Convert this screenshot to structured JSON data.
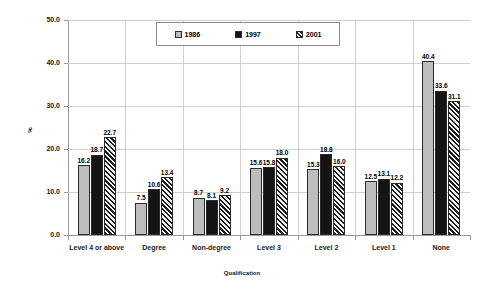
{
  "chart_data": {
    "type": "bar",
    "title": "",
    "xlabel": "Qualification",
    "ylabel": "%",
    "ylim": [
      0,
      50
    ],
    "ytick_labels": [
      "0.0",
      "10.0",
      "20.0",
      "30.0",
      "40.0",
      "50.0"
    ],
    "ytick_values": [
      0,
      10,
      20,
      30,
      40,
      50
    ],
    "grid": "horizontal-and-vertical",
    "legend_position": "top-center",
    "categories": [
      "Level 4 or above",
      "Degree",
      "Non-degree",
      "Level 3",
      "Level 2",
      "Level 1",
      "None"
    ],
    "series": [
      {
        "name": "1986",
        "style": "solid-light-gray",
        "color": "#bdbdbd",
        "values": [
          16.2,
          7.5,
          8.7,
          15.6,
          15.3,
          12.5,
          40.4
        ],
        "labels": [
          "16.2",
          "7.5",
          "8.7",
          "15.6",
          "15.3",
          "12.5",
          "40.4"
        ]
      },
      {
        "name": "1997",
        "style": "solid-black",
        "color": "#141414",
        "values": [
          18.7,
          10.6,
          8.1,
          15.8,
          18.8,
          13.1,
          33.6
        ],
        "labels": [
          "18.7",
          "10.6",
          "8.1",
          "15.8",
          "18.8",
          "13.1",
          "33.6"
        ]
      },
      {
        "name": "2001",
        "style": "diagonal-hatch",
        "color": "#1c1c1c",
        "values": [
          22.7,
          13.4,
          9.2,
          18.0,
          16.0,
          12.2,
          31.1
        ],
        "labels": [
          "22.7",
          "13.4",
          "9.2",
          "18.0",
          "16.0",
          "12.2",
          "31.1"
        ]
      }
    ]
  },
  "legend": {
    "entries": [
      {
        "label": "1986"
      },
      {
        "label": "1997"
      },
      {
        "label": "2001"
      }
    ]
  }
}
